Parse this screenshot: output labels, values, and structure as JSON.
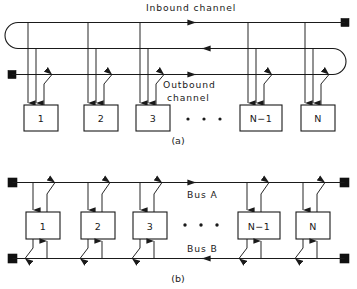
{
  "figure": {
    "background_color": "#ffffff",
    "line_color": "#1a1a1a",
    "terminator_color": "#111111"
  },
  "panel_a": {
    "caption": "(a)",
    "inbound_label": "Inbound  channel",
    "outbound_label_line1": "Outbound",
    "outbound_label_line2": "channel",
    "ellipsis": "•   •   •",
    "nodes": [
      {
        "label": "1"
      },
      {
        "label": "2"
      },
      {
        "label": "3"
      },
      {
        "label": "N−1"
      },
      {
        "label": "N"
      }
    ]
  },
  "panel_b": {
    "caption": "(b)",
    "bus_a_label": "Bus  A",
    "bus_b_label": "Bus  B",
    "ellipsis": "•   •   •",
    "nodes": [
      {
        "label": "1"
      },
      {
        "label": "2"
      },
      {
        "label": "3"
      },
      {
        "label": "N−1"
      },
      {
        "label": "N"
      }
    ]
  }
}
